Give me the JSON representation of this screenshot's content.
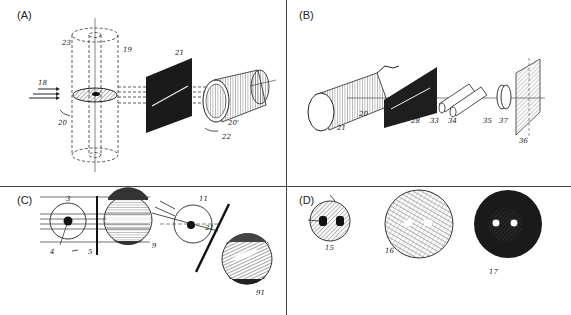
{
  "figure": {
    "panels": [
      {
        "id": "A",
        "label": "(A)",
        "part_numbers": [
          "23",
          "19",
          "18",
          "20",
          "21",
          "22",
          "20'"
        ]
      },
      {
        "id": "B",
        "label": "(B)",
        "part_numbers": [
          "21",
          "20",
          "28",
          "33",
          "34",
          "35",
          "37",
          "36"
        ]
      },
      {
        "id": "C",
        "label": "(C)",
        "part_numbers": [
          "3",
          "4",
          "5",
          "9",
          "11",
          "21",
          "91"
        ]
      },
      {
        "id": "D",
        "label": "(D)",
        "part_numbers": [
          "15",
          "16",
          "17"
        ]
      }
    ]
  }
}
